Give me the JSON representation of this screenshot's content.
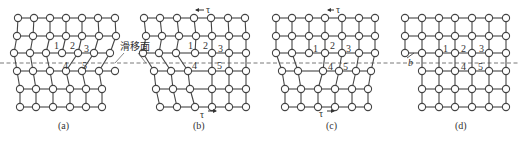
{
  "figure": {
    "slip_plane_label": "滑移面",
    "shear_symbol": "τ",
    "burgers_symbol": "b",
    "atom_labels": [
      "1",
      "2",
      "3",
      "4",
      "5"
    ],
    "colors": {
      "line": "#444444",
      "atom_fill": "#ffffff",
      "text": "#333333"
    },
    "panels": [
      {
        "id": "a",
        "caption": "(a)",
        "shear_top": false,
        "shear_bottom": false
      },
      {
        "id": "b",
        "caption": "(b)",
        "shear_top": true,
        "shear_bottom": true
      },
      {
        "id": "c",
        "caption": "(c)",
        "shear_top": true,
        "shear_bottom": true
      },
      {
        "id": "d",
        "caption": "(d)",
        "shear_top": false,
        "shear_bottom": false,
        "step_label": "b"
      }
    ]
  }
}
